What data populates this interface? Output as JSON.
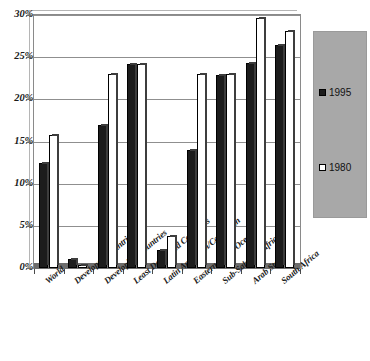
{
  "chart_data": {
    "type": "bar",
    "title": "",
    "xlabel": "",
    "ylabel": "",
    "ylim": [
      0,
      30
    ],
    "y_tick_labels": [
      "0%",
      "5%",
      "10%",
      "15%",
      "20%",
      "25%",
      "30%"
    ],
    "y_tick_values": [
      0,
      5,
      10,
      15,
      20,
      25,
      30
    ],
    "grid": true,
    "legend_position": "right",
    "categories": [
      "World",
      "Developed Countries",
      "Developing Countries",
      "Least Developed Countries",
      "Latin American/Caribbean",
      "Eastern Asian/Oceania",
      "Sub-Saharan Africa",
      "Arab States",
      "South Africa"
    ],
    "series": [
      {
        "name": "1995",
        "style": "dark-hatched",
        "color": "#1c1c1c",
        "values": [
          12.5,
          1.1,
          17.0,
          24.2,
          2.1,
          14.0,
          22.9,
          24.3,
          26.4
        ]
      },
      {
        "name": "1980",
        "style": "open-white",
        "color": "#ffffff",
        "values": [
          15.8,
          0.3,
          23.0,
          24.2,
          3.8,
          23.0,
          23.0,
          29.7,
          28.1
        ]
      }
    ]
  },
  "legend": {
    "entries": [
      {
        "label": "1995"
      },
      {
        "label": "1980"
      }
    ]
  },
  "colors": {
    "series_1995": "#1c1c1c",
    "series_1980": "#ffffff",
    "legend_background": "#a8a8a8",
    "gridline": "#8f8f8f",
    "axis": "#6d6d6d"
  }
}
